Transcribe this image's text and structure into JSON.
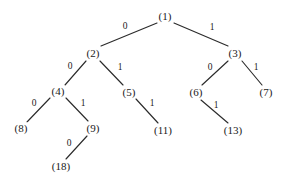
{
  "figure": {
    "type": "binary-tree-diagram",
    "background_color": "#ffffff",
    "line_color": "#2b2b2b",
    "text_color": "#1a1a1a",
    "width": 284,
    "height": 184
  },
  "nodes": [
    {
      "id": "n1",
      "label": "(1)",
      "value": 1,
      "x": 165,
      "y": 16,
      "depth": 0
    },
    {
      "id": "n2",
      "label": "(2)",
      "value": 2,
      "x": 93,
      "y": 53,
      "depth": 1
    },
    {
      "id": "n3",
      "label": "(3)",
      "value": 3,
      "x": 235,
      "y": 53,
      "depth": 1
    },
    {
      "id": "n4",
      "label": "(4)",
      "value": 4,
      "x": 58,
      "y": 91,
      "depth": 2
    },
    {
      "id": "n5",
      "label": "(5)",
      "value": 5,
      "x": 129,
      "y": 92,
      "depth": 2
    },
    {
      "id": "n6",
      "label": "(6)",
      "value": 6,
      "x": 196,
      "y": 92,
      "depth": 2
    },
    {
      "id": "n7",
      "label": "(7)",
      "value": 7,
      "x": 266,
      "y": 92,
      "depth": 2
    },
    {
      "id": "n8",
      "label": "(8)",
      "value": 8,
      "x": 21,
      "y": 128,
      "depth": 3
    },
    {
      "id": "n9",
      "label": "(9)",
      "value": 9,
      "x": 93,
      "y": 128,
      "depth": 3
    },
    {
      "id": "n11",
      "label": "(11)",
      "value": 11,
      "x": 163,
      "y": 130,
      "depth": 3
    },
    {
      "id": "n13",
      "label": "(13)",
      "value": 13,
      "x": 233,
      "y": 130,
      "depth": 3
    },
    {
      "id": "n18",
      "label": "(18)",
      "value": 18,
      "x": 61,
      "y": 166,
      "depth": 4
    }
  ],
  "edges": [
    {
      "id": "e1",
      "from": "n1",
      "to": "n2",
      "label": "0",
      "x1": 157,
      "y1": 23,
      "x2": 101,
      "y2": 46,
      "lx": 125,
      "ly": 27
    },
    {
      "id": "e2",
      "from": "n1",
      "to": "n3",
      "label": "1",
      "x1": 174,
      "y1": 23,
      "x2": 228,
      "y2": 46,
      "lx": 212,
      "ly": 28
    },
    {
      "id": "e3",
      "from": "n2",
      "to": "n4",
      "label": "0",
      "x1": 86,
      "y1": 61,
      "x2": 65,
      "y2": 85,
      "lx": 70,
      "ly": 67
    },
    {
      "id": "e4",
      "from": "n2",
      "to": "n5",
      "label": "1",
      "x1": 100,
      "y1": 61,
      "x2": 123,
      "y2": 85,
      "lx": 120,
      "ly": 68
    },
    {
      "id": "e5",
      "from": "n4",
      "to": "n8",
      "label": "0",
      "x1": 50,
      "y1": 98,
      "x2": 27,
      "y2": 122,
      "lx": 34,
      "ly": 104
    },
    {
      "id": "e6",
      "from": "n4",
      "to": "n9",
      "label": "1",
      "x1": 66,
      "y1": 98,
      "x2": 88,
      "y2": 121,
      "lx": 83,
      "ly": 104
    },
    {
      "id": "e7",
      "from": "n5",
      "to": "n11",
      "label": "1",
      "x1": 136,
      "y1": 99,
      "x2": 158,
      "y2": 123,
      "lx": 152,
      "ly": 104
    },
    {
      "id": "e8",
      "from": "n9",
      "to": "n18",
      "label": "0",
      "x1": 87,
      "y1": 136,
      "x2": 66,
      "y2": 159,
      "lx": 69,
      "ly": 144
    },
    {
      "id": "e9",
      "from": "n3",
      "to": "n6",
      "label": "0",
      "x1": 228,
      "y1": 61,
      "x2": 202,
      "y2": 85,
      "lx": 210,
      "ly": 68
    },
    {
      "id": "e10",
      "from": "n3",
      "to": "n7",
      "label": "1",
      "x1": 242,
      "y1": 61,
      "x2": 262,
      "y2": 85,
      "lx": 256,
      "ly": 68
    },
    {
      "id": "e11",
      "from": "n6",
      "to": "n13",
      "label": "1",
      "x1": 201,
      "y1": 100,
      "x2": 228,
      "y2": 123,
      "lx": 216,
      "ly": 106
    }
  ]
}
